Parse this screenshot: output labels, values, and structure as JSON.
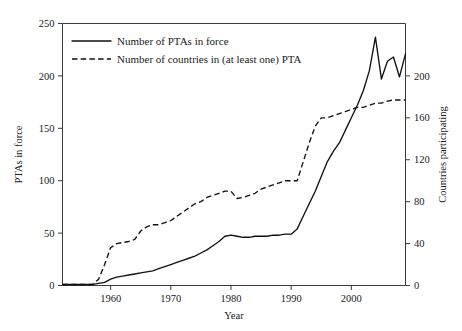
{
  "chart_data": {
    "type": "line",
    "title": "",
    "xlabel": "Year",
    "ylabel": "PTAs in force",
    "y2label": "Countries participating",
    "xlim": [
      1952,
      2009
    ],
    "ylim": [
      0,
      250
    ],
    "y2lim": [
      0,
      250
    ],
    "xticks": [
      1960,
      1970,
      1980,
      1990,
      2000
    ],
    "xtick_labels": [
      "1960",
      "1970",
      "1980",
      "1990",
      "2000"
    ],
    "yticks": [
      0,
      50,
      100,
      150,
      200,
      250
    ],
    "ytick_labels": [
      "0",
      "50",
      "100",
      "150",
      "200",
      "250"
    ],
    "y2ticks": [
      0,
      40,
      80,
      120,
      160,
      200
    ],
    "y2tick_labels": [
      "0",
      "40",
      "80",
      "120",
      "160",
      "200"
    ],
    "grid": false,
    "legend_position": "upper-left-inside",
    "series": [
      {
        "name": "Number of PTAs in force",
        "style": "solid",
        "axis": "left",
        "color": "#111111",
        "x": [
          1952,
          1953,
          1954,
          1955,
          1956,
          1957,
          1958,
          1959,
          1960,
          1961,
          1962,
          1963,
          1964,
          1965,
          1966,
          1967,
          1968,
          1969,
          1970,
          1971,
          1972,
          1973,
          1974,
          1975,
          1976,
          1977,
          1978,
          1979,
          1980,
          1981,
          1982,
          1983,
          1984,
          1985,
          1986,
          1987,
          1988,
          1989,
          1990,
          1991,
          1992,
          1993,
          1994,
          1995,
          1996,
          1997,
          1998,
          1999,
          2000,
          2001,
          2002,
          2003,
          2004,
          2005,
          2006,
          2007,
          2008,
          2009
        ],
        "y": [
          1,
          1,
          1,
          1,
          1,
          1,
          2,
          3,
          6,
          8,
          9,
          10,
          11,
          12,
          13,
          14,
          16,
          18,
          20,
          22,
          24,
          26,
          28,
          31,
          34,
          38,
          42,
          47,
          48,
          47,
          46,
          46,
          47,
          47,
          47,
          48,
          48,
          49,
          49,
          54,
          66,
          78,
          90,
          104,
          118,
          128,
          136,
          148,
          160,
          172,
          186,
          205,
          237,
          197,
          214,
          218,
          199,
          221
        ]
      },
      {
        "name": "Number of countries in (at least one) PTA",
        "style": "dashed",
        "axis": "right",
        "color": "#111111",
        "x": [
          1952,
          1953,
          1954,
          1955,
          1956,
          1957,
          1958,
          1959,
          1960,
          1961,
          1962,
          1963,
          1964,
          1965,
          1966,
          1967,
          1968,
          1969,
          1970,
          1971,
          1972,
          1973,
          1974,
          1975,
          1976,
          1977,
          1978,
          1979,
          1980,
          1981,
          1982,
          1983,
          1984,
          1985,
          1986,
          1987,
          1988,
          1989,
          1990,
          1991,
          1992,
          1993,
          1994,
          1995,
          1996,
          1997,
          1998,
          1999,
          2000,
          2001,
          2002,
          2003,
          2004,
          2005,
          2006,
          2007,
          2008,
          2009
        ],
        "y": [
          1,
          1,
          1,
          1,
          1,
          1,
          6,
          20,
          36,
          40,
          41,
          42,
          44,
          52,
          56,
          58,
          58,
          60,
          62,
          66,
          70,
          74,
          78,
          80,
          84,
          86,
          88,
          90,
          90,
          83,
          84,
          86,
          88,
          92,
          94,
          96,
          98,
          100,
          100,
          100,
          118,
          136,
          152,
          160,
          160,
          162,
          164,
          166,
          168,
          170,
          170,
          172,
          174,
          174,
          176,
          177,
          177,
          177
        ]
      }
    ]
  },
  "axes": {
    "left_title": "PTAs in force",
    "right_title": "Countries participating",
    "bottom_title": "Year"
  },
  "legend": {
    "items": [
      {
        "label": "Number of PTAs in force",
        "style": "solid"
      },
      {
        "label": "Number of countries in (at least one) PTA",
        "style": "dashed"
      }
    ]
  }
}
